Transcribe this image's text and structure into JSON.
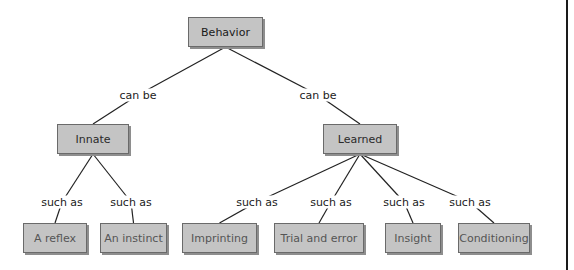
{
  "nodes": {
    "behavior": "Behavior",
    "innate": "Innate",
    "learned": "Learned",
    "reflex": "A reflex",
    "instinct": "An instinct",
    "imprinting": "Imprinting",
    "trial": "Trial and error",
    "insight": "Insight",
    "conditioning": "Conditioning"
  },
  "links": {
    "behavior_innate": "can be",
    "behavior_learned": "can be",
    "innate_reflex": "such as",
    "innate_instinct": "such as",
    "learned_imprinting": "such as",
    "learned_trial": "such as",
    "learned_insight": "such as",
    "learned_conditioning": "such as"
  },
  "edges": [
    [
      "behavior",
      "innate",
      "behavior_innate"
    ],
    [
      "behavior",
      "learned",
      "behavior_learned"
    ],
    [
      "innate",
      "reflex",
      "innate_reflex"
    ],
    [
      "innate",
      "instinct",
      "innate_instinct"
    ],
    [
      "learned",
      "imprinting",
      "learned_imprinting"
    ],
    [
      "learned",
      "trial",
      "learned_trial"
    ],
    [
      "learned",
      "insight",
      "learned_insight"
    ],
    [
      "learned",
      "conditioning",
      "learned_conditioning"
    ]
  ]
}
